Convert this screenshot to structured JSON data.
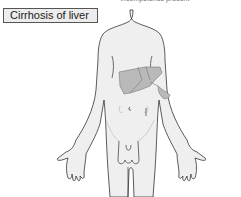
{
  "header": {
    "caption": "incompetence present"
  },
  "label": {
    "text": "Cirrhosis of liver"
  },
  "figure": {
    "highlight": "liver-and-spleen",
    "colors": {
      "skin": "#efefef",
      "outline": "#333333",
      "organ_fill": "#b9b9b9",
      "organ_outline": "#777777"
    }
  }
}
